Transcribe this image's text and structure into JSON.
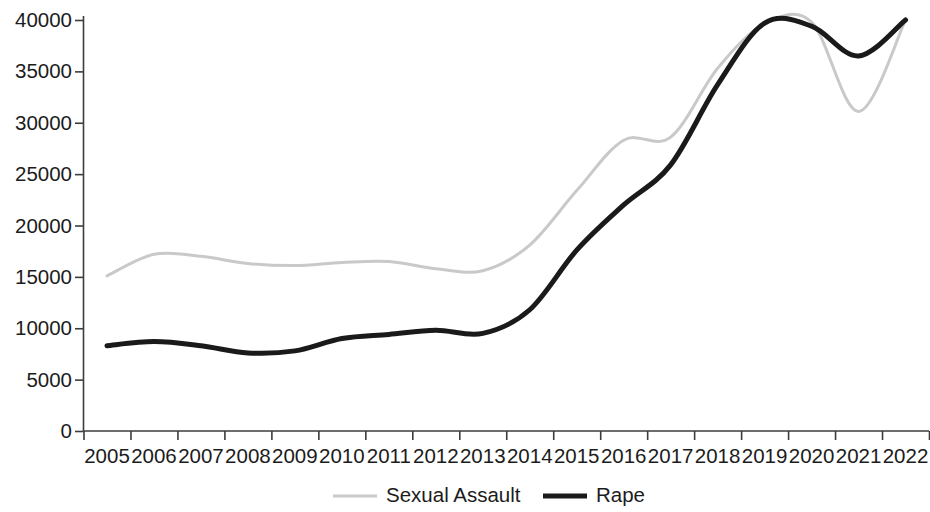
{
  "chart_data": {
    "type": "line",
    "title": "",
    "subtitle": "",
    "xlabel": "",
    "ylabel": "",
    "categories": [
      "2005",
      "2006",
      "2007",
      "2008",
      "2009",
      "2010",
      "2011",
      "2012",
      "2013",
      "2014",
      "2015",
      "2016",
      "2017",
      "2018",
      "2019",
      "2020",
      "2021",
      "2022"
    ],
    "x_tick_labels": [
      "2005",
      "2006",
      "2007",
      "2008",
      "2009",
      "2010",
      "2011",
      "2012",
      "2013",
      "2014",
      "2015",
      "2016",
      "2017",
      "2018",
      "2019",
      "2020",
      "2021",
      "2022"
    ],
    "y_tick_labels": [
      "0",
      "5000",
      "10000",
      "15000",
      "20000",
      "25000",
      "30000",
      "35000",
      "40000"
    ],
    "y_ticks": [
      0,
      5000,
      10000,
      15000,
      20000,
      25000,
      30000,
      35000,
      40000
    ],
    "ylim": [
      0,
      40000
    ],
    "grid": false,
    "smoothing": "spline",
    "legend_position": "bottom",
    "series": [
      {
        "name": "Sexual Assault",
        "color": "#c9c9c9",
        "line_width": 3,
        "values": [
          15100,
          17200,
          17000,
          16300,
          16100,
          16400,
          16500,
          15800,
          15600,
          18100,
          23400,
          28300,
          28600,
          35300,
          39600,
          39800,
          31100,
          40000
        ]
      },
      {
        "name": "Rape",
        "color": "#1a1a1a",
        "line_width": 5,
        "values": [
          8300,
          8700,
          8300,
          7600,
          7800,
          9000,
          9400,
          9800,
          9500,
          11800,
          17600,
          22000,
          25900,
          33700,
          39700,
          39400,
          36500,
          40000
        ]
      }
    ]
  },
  "legend": {
    "items": [
      {
        "label": "Sexual Assault",
        "swatch": "legend-swatch-sexual-assault"
      },
      {
        "label": "Rape",
        "swatch": "legend-swatch-rape"
      }
    ]
  },
  "axes": {
    "y_axis_name": "y-axis",
    "x_axis_name": "x-axis"
  }
}
